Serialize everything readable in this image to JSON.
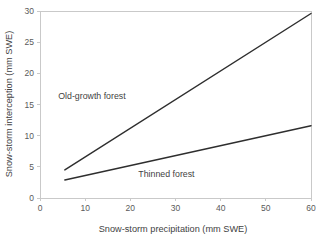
{
  "chart_data": {
    "type": "line",
    "title": "",
    "xlabel": "Snow-storm precipitation (mm SWE)",
    "ylabel": "Snow-storm interception (mm SWE)",
    "xlim": [
      0,
      60
    ],
    "ylim": [
      0,
      30
    ],
    "xticks": [
      0,
      10,
      20,
      30,
      40,
      50,
      60
    ],
    "xticklabels": [
      "0",
      "10",
      "20",
      "30",
      "40",
      "50",
      "60"
    ],
    "yticks": [
      0,
      5,
      10,
      15,
      20,
      25,
      30
    ],
    "yticklabels": [
      "0",
      "5",
      "10",
      "15",
      "20",
      "25",
      "30"
    ],
    "grid": false,
    "legend": "inline-annotations",
    "line_color": "#2e2e2e",
    "axis_color": "#c9c9c9",
    "text_color": "#3f3f3f",
    "background": "#ffffff",
    "series": [
      {
        "name": "Old-growth forest",
        "x": [
          5.5,
          60
        ],
        "values": [
          4.5,
          29.6
        ],
        "annotation": {
          "text": "Old-growth forest",
          "x": 11.5,
          "y": 15.9
        }
      },
      {
        "name": "Thinned forest",
        "x": [
          5.5,
          60
        ],
        "values": [
          2.9,
          11.6
        ],
        "annotation": {
          "text": "Thinned forest",
          "x": 28.0,
          "y": 3.4
        }
      }
    ]
  }
}
